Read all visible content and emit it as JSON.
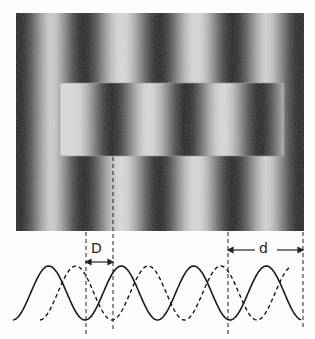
{
  "figure": {
    "photo": {
      "x": 16,
      "y": 13,
      "width": 288,
      "height": 218,
      "period": 74.5,
      "outer_dark_stripes_x": [
        19,
        84,
        159,
        233,
        300
      ],
      "inset": {
        "x": 60,
        "y": 83,
        "width": 224,
        "height": 73,
        "dark_stripes_x": [
          112,
          186,
          260
        ]
      }
    },
    "labels": {
      "shift": "D",
      "period": "d"
    },
    "curves": {
      "solid_phase_trough_x": 85,
      "dashed_phase_trough_x": 112,
      "period": 72.5,
      "baseline_y": 320,
      "peak_y": 266
    },
    "guides_x": [
      86,
      113,
      228,
      303
    ],
    "colors": {
      "background": "#fdfdfd",
      "ink": "#222222",
      "stripe_dark": "#1e1e1e",
      "stripe_light": "#d9d9d9"
    }
  }
}
